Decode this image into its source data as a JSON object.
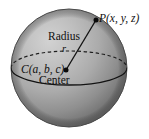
{
  "figure": {
    "kind": "sphere-geometry-diagram",
    "background_color": "#ffffff",
    "labels": {
      "point_p": "P(x, y, z)",
      "radius_word": "Radius",
      "radius_symbol": "r",
      "center_point": "C(a, b, c)",
      "center_word": "Center"
    },
    "colors": {
      "sphere_light": "#c6c6c6",
      "sphere_mid": "#a9a9a9",
      "sphere_dark": "#6f6f6f",
      "outline": "#3a3a3a",
      "text": "#111111",
      "marker": "#0a0a0a"
    },
    "geometry": {
      "sphere_center_x": 69,
      "sphere_center_y": 68,
      "sphere_radius_x": 58,
      "sphere_radius_y": 59,
      "equator_rx": 58,
      "equator_ry": 17,
      "center_marker_x": 66,
      "center_marker_y": 70,
      "surface_point_x": 96,
      "surface_point_y": 20
    }
  }
}
